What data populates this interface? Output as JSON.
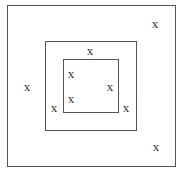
{
  "diagram": {
    "boxes": [
      {
        "name": "outer",
        "x": 7,
        "y": 5,
        "w": 169,
        "h": 162
      },
      {
        "name": "middle",
        "x": 45,
        "y": 41,
        "w": 92,
        "h": 90
      },
      {
        "name": "inner",
        "x": 63,
        "y": 59,
        "w": 56,
        "h": 54
      }
    ],
    "marks": [
      {
        "label": "x",
        "x": 155,
        "y": 23
      },
      {
        "label": "x",
        "x": 90,
        "y": 50
      },
      {
        "label": "x",
        "x": 27,
        "y": 86
      },
      {
        "label": "x",
        "x": 71,
        "y": 73
      },
      {
        "label": "x",
        "x": 110,
        "y": 86
      },
      {
        "label": "x",
        "x": 71,
        "y": 98
      },
      {
        "label": "x",
        "x": 54,
        "y": 107
      },
      {
        "label": "x",
        "x": 126,
        "y": 107
      },
      {
        "label": "x",
        "x": 156,
        "y": 146
      }
    ]
  }
}
